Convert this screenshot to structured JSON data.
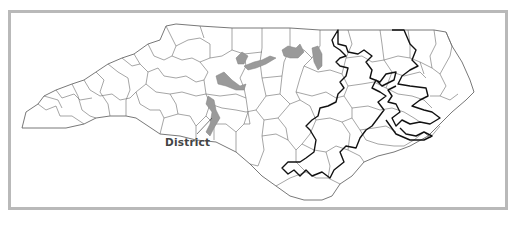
{
  "map": {
    "subject": "North Carolina congressional districts over county boundaries",
    "label": "District",
    "layers": [
      {
        "name": "county-boundaries",
        "style": "thin gray outlines"
      },
      {
        "name": "shaded-district",
        "style": "gray fill",
        "color": "#9a9a9a"
      },
      {
        "name": "outlined-district",
        "style": "bold black outline",
        "color": "#111111"
      }
    ],
    "frame_color": "#b9b9b9"
  }
}
